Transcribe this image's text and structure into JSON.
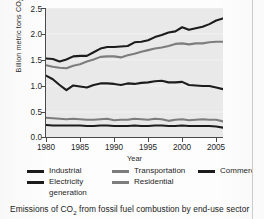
{
  "caption": "Emissions of CO2 from fossil fuel combustion by end-use sector",
  "caption_pre": "Emissions of CO",
  "caption_sub": "2",
  "caption_post": " from fossil fuel combustion by end-use sector",
  "axis": {
    "ylabel_pre": "Billion metric tons CO",
    "ylabel_sub": "2",
    "xlabel": "Year",
    "yticks": [
      "0.0",
      "0.5",
      "1.0",
      "1.5",
      "2.0",
      "2.5"
    ],
    "xticks": [
      "1980",
      "1985",
      "1990",
      "1995",
      "2000",
      "2005"
    ]
  },
  "legend": {
    "items": [
      {
        "label": "Industrial",
        "color": "#1c1c1c"
      },
      {
        "label": "Electricity\ngeneration",
        "color": "#1c1c1c"
      },
      {
        "label": "Transportation",
        "color": "#7d7d7d"
      },
      {
        "label": "Residential",
        "color": "#7d7d7d"
      },
      {
        "label": "Commercial",
        "color": "#1c1c1c"
      }
    ]
  },
  "chart_data": {
    "type": "line",
    "title": "",
    "xlabel": "Year",
    "ylabel": "Billion metric tons CO2",
    "xlim": [
      1980,
      2006
    ],
    "ylim": [
      0.0,
      2.5
    ],
    "yticks": [
      0.0,
      0.5,
      1.0,
      1.5,
      2.0,
      2.5
    ],
    "xticks": [
      1980,
      1985,
      1990,
      1995,
      2000,
      2005
    ],
    "grid": false,
    "legend_position": "below",
    "x": [
      1980,
      1981,
      1982,
      1983,
      1984,
      1985,
      1986,
      1987,
      1988,
      1989,
      1990,
      1991,
      1992,
      1993,
      1994,
      1995,
      1996,
      1997,
      1998,
      1999,
      2000,
      2001,
      2002,
      2003,
      2004,
      2005,
      2006
    ],
    "series": [
      {
        "name": "Electricity generation",
        "color": "#1c1c1c",
        "values": [
          1.53,
          1.52,
          1.47,
          1.51,
          1.57,
          1.58,
          1.58,
          1.65,
          1.72,
          1.75,
          1.75,
          1.76,
          1.77,
          1.84,
          1.85,
          1.88,
          1.94,
          1.98,
          2.03,
          2.05,
          2.13,
          2.08,
          2.11,
          2.14,
          2.19,
          2.26,
          2.3
        ]
      },
      {
        "name": "Transportation",
        "color": "#7d7d7d",
        "values": [
          1.4,
          1.37,
          1.35,
          1.34,
          1.39,
          1.42,
          1.47,
          1.51,
          1.56,
          1.57,
          1.57,
          1.55,
          1.59,
          1.62,
          1.66,
          1.69,
          1.72,
          1.74,
          1.77,
          1.81,
          1.82,
          1.8,
          1.82,
          1.82,
          1.84,
          1.85,
          1.85
        ]
      },
      {
        "name": "Industrial",
        "color": "#1c1c1c",
        "values": [
          1.2,
          1.13,
          1.02,
          0.92,
          1.01,
          0.99,
          0.97,
          1.02,
          1.05,
          1.05,
          1.04,
          1.02,
          1.05,
          1.04,
          1.06,
          1.07,
          1.09,
          1.1,
          1.07,
          1.07,
          1.08,
          1.02,
          1.01,
          1.0,
          1.0,
          0.97,
          0.94
        ]
      },
      {
        "name": "Residential",
        "color": "#7d7d7d",
        "values": [
          0.39,
          0.38,
          0.37,
          0.36,
          0.37,
          0.36,
          0.35,
          0.35,
          0.36,
          0.37,
          0.34,
          0.35,
          0.35,
          0.37,
          0.36,
          0.35,
          0.37,
          0.36,
          0.33,
          0.35,
          0.36,
          0.34,
          0.35,
          0.36,
          0.35,
          0.35,
          0.32
        ]
      },
      {
        "name": "Commercial",
        "color": "#1c1c1c",
        "values": [
          0.25,
          0.24,
          0.24,
          0.24,
          0.24,
          0.24,
          0.23,
          0.23,
          0.24,
          0.24,
          0.23,
          0.23,
          0.23,
          0.24,
          0.23,
          0.23,
          0.24,
          0.24,
          0.23,
          0.23,
          0.24,
          0.23,
          0.23,
          0.23,
          0.23,
          0.22,
          0.2
        ]
      }
    ]
  }
}
